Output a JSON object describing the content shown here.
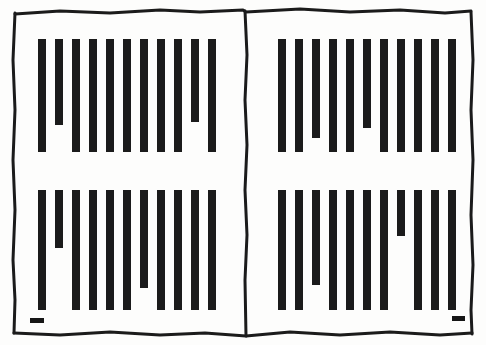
{
  "figure": {
    "type": "scanned-two-page-bar-pattern",
    "width": 486,
    "height": 345,
    "background_color": "#fdfdfc",
    "ink_color": "#1b1b1b",
    "frame": {
      "name": "hand-drawn-double-page-border",
      "outer_left": 14,
      "outer_top": 12,
      "outer_right": 472,
      "outer_bottom": 334,
      "center_divider_x": 246,
      "stroke_width": 3
    },
    "panels": [
      {
        "name": "top-left-panel",
        "position": "top-left",
        "bar_count": 11,
        "bar_width": 8,
        "bar_pitch": 17,
        "first_bar_x": 38,
        "bar_top_y": 39,
        "bar_bottom_y": 152,
        "short_bars": [
          {
            "index": 2,
            "bottom_y": 125
          },
          {
            "index": 10,
            "bottom_y": 122
          }
        ],
        "tick_mark": null
      },
      {
        "name": "top-right-panel",
        "position": "top-right",
        "bar_count": 11,
        "bar_width": 8,
        "bar_pitch": 17,
        "first_bar_x": 278,
        "bar_top_y": 39,
        "bar_bottom_y": 152,
        "short_bars": [
          {
            "index": 3,
            "bottom_y": 138
          },
          {
            "index": 6,
            "bottom_y": 128
          }
        ],
        "tick_mark": null
      },
      {
        "name": "bottom-left-panel",
        "position": "bottom-left",
        "bar_count": 11,
        "bar_width": 8,
        "bar_pitch": 17,
        "first_bar_x": 38,
        "bar_top_y": 190,
        "bar_bottom_y": 310,
        "short_bars": [
          {
            "index": 2,
            "bottom_y": 248
          },
          {
            "index": 7,
            "bottom_y": 288
          }
        ],
        "tick_mark": {
          "name": "bottom-left-tick",
          "x": 30,
          "y": 318,
          "width": 14,
          "height": 5
        }
      },
      {
        "name": "bottom-right-panel",
        "position": "bottom-right",
        "bar_count": 11,
        "bar_width": 8,
        "bar_pitch": 17,
        "first_bar_x": 278,
        "bar_top_y": 190,
        "bar_bottom_y": 310,
        "short_bars": [
          {
            "index": 3,
            "bottom_y": 285
          },
          {
            "index": 8,
            "bottom_y": 236
          }
        ],
        "tick_mark": {
          "name": "bottom-right-tick",
          "x": 452,
          "y": 316,
          "width": 13,
          "height": 5
        }
      }
    ]
  }
}
